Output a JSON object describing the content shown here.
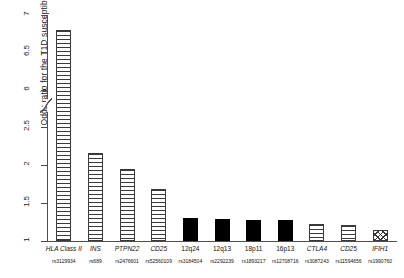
{
  "chart_data": {
    "type": "bar",
    "title": "",
    "xlabel": "",
    "ylabel": "Odds ratio for the T1D susceptibility allele",
    "ylim": [
      1,
      7
    ],
    "y_axis_break": {
      "from": 2.7,
      "to": 5.85
    },
    "y_ticks": [
      "1",
      "1.5",
      "2",
      "2.5",
      "6",
      "6.5",
      "7"
    ],
    "y_tick_values": [
      1,
      1.5,
      2,
      2.5,
      6,
      6.5,
      7
    ],
    "grid": false,
    "legend_position": "none",
    "categories": [
      "HLA Class II",
      "INS",
      "PTPN22",
      "CD25",
      "12q24",
      "12q13",
      "18p11",
      "16p13",
      "CTLA4",
      "CD25",
      "IFIH1"
    ],
    "snps": [
      "rs3129934",
      "rs689",
      "rs2476601",
      "rs52560109",
      "rs3184504",
      "rs2292239",
      "rs1893217",
      "rs12708716",
      "rs3087243",
      "rs11594656",
      "rs1990760"
    ],
    "gene_italic": [
      true,
      true,
      true,
      true,
      false,
      false,
      false,
      false,
      true,
      true,
      true
    ],
    "values": [
      6.8,
      2.16,
      1.95,
      1.68,
      1.3,
      1.29,
      1.28,
      1.28,
      1.22,
      1.21,
      1.15
    ],
    "patterns": [
      "hline",
      "hline",
      "hline",
      "hline",
      "solid",
      "solid",
      "solid",
      "solid",
      "hline",
      "hline",
      "cross"
    ],
    "colors": {
      "hatch": "#3a3a3a",
      "solid": "#000000",
      "axis": "#4d4d4d",
      "text": "#111111",
      "background": "#ffffff"
    }
  }
}
